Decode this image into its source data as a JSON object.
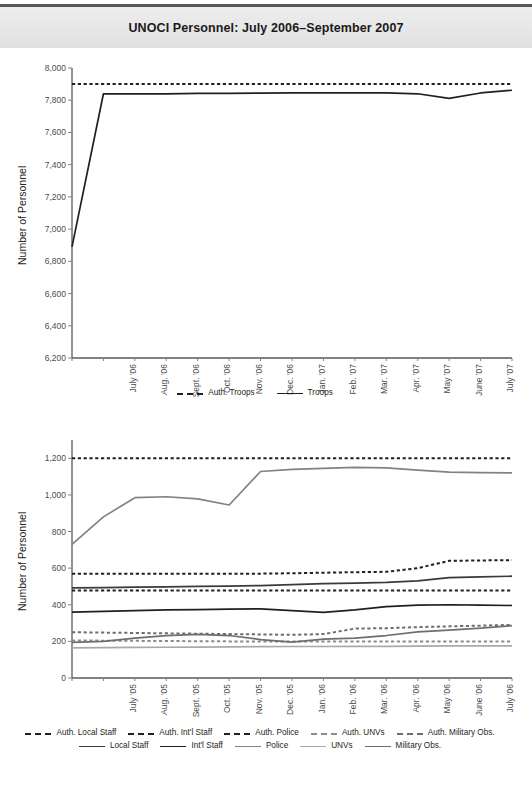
{
  "header": {
    "title": "UNOCI Personnel: July 2006–September 2007"
  },
  "chart_data": [
    {
      "id": "top",
      "type": "line",
      "title": "UNOCI Personnel: July 2006–September 2007",
      "xlabel": "",
      "ylabel": "Number of Personnel",
      "ylim": [
        6200,
        8000
      ],
      "ytick_labels": [
        "8,000",
        "7,800",
        "7,600",
        "7,400",
        "7,200",
        "7,000",
        "6,800",
        "6,600",
        "6,400",
        "6,200"
      ],
      "yticks": [
        8000,
        7800,
        7600,
        7400,
        7200,
        7000,
        6800,
        6600,
        6400,
        6200
      ],
      "grid": false,
      "legend_position": "bottom",
      "categories": [
        "July '06",
        "Aug. '06",
        "Sept. '06",
        "Oct. '06",
        "Nov. '06",
        "Dec. '06",
        "Jan. '07",
        "Feb. '07",
        "Mar. '07",
        "Apr. '07",
        "May '07",
        "June '07",
        "July '07",
        "Aug. '07",
        "Sept. '07"
      ],
      "series": [
        {
          "name": "Auth. Troops",
          "style": "dashed",
          "color": "#231f20",
          "values": [
            7900,
            7900,
            7900,
            7900,
            7900,
            7900,
            7900,
            7900,
            7900,
            7900,
            7900,
            7900,
            7900,
            7900,
            7900
          ]
        },
        {
          "name": "Troops",
          "style": "solid",
          "color": "#231f20",
          "values": [
            6890,
            7840,
            7840,
            7840,
            7842,
            7843,
            7844,
            7845,
            7845,
            7846,
            7845,
            7840,
            7812,
            7845,
            7862
          ]
        }
      ]
    },
    {
      "id": "bottom",
      "type": "line",
      "title": "",
      "xlabel": "",
      "ylabel": "Number of Personnel",
      "ylim": [
        0,
        1300
      ],
      "ytick_labels": [
        "1,200",
        "1,000",
        "800",
        "600",
        "400",
        "200",
        "0"
      ],
      "yticks": [
        1200,
        1000,
        800,
        600,
        400,
        200,
        0
      ],
      "grid": false,
      "legend_position": "bottom",
      "categories": [
        "July '05",
        "Aug. '05",
        "Sept. '05",
        "Oct. '05",
        "Nov. '05",
        "Dec. '05",
        "Jan. '06",
        "Feb. '06",
        "Mar. '06",
        "Apr. '06",
        "May '06",
        "June '06",
        "July '06",
        "Aug. '06",
        "Sept. '06"
      ],
      "series": [
        {
          "name": "Auth. Local Staff",
          "style": "dashed",
          "color": "#231f20",
          "values": [
            570,
            570,
            570,
            570,
            570,
            570,
            570,
            572,
            575,
            578,
            580,
            600,
            640,
            642,
            644
          ]
        },
        {
          "name": "Auth. Int'l Staff",
          "style": "dashed",
          "color": "#231f20",
          "values": [
            478,
            478,
            478,
            478,
            478,
            478,
            478,
            478,
            478,
            478,
            478,
            478,
            478,
            478,
            478
          ]
        },
        {
          "name": "Auth. Police",
          "style": "dashed",
          "color": "#231f20",
          "values": [
            1200,
            1200,
            1200,
            1200,
            1200,
            1200,
            1200,
            1200,
            1200,
            1200,
            1200,
            1200,
            1200,
            1200,
            1200
          ]
        },
        {
          "name": "Auth. UNVs",
          "style": "dashed",
          "color": "#8c8c8c",
          "values": [
            205,
            204,
            203,
            202,
            201,
            200,
            200,
            200,
            200,
            200,
            200,
            200,
            200,
            200,
            200
          ]
        },
        {
          "name": "Auth. Military Obs.",
          "style": "dashed",
          "color": "#6d6e71",
          "values": [
            250,
            248,
            246,
            244,
            242,
            240,
            238,
            236,
            240,
            270,
            272,
            278,
            282,
            286,
            290
          ]
        },
        {
          "name": "Local Staff",
          "style": "solid",
          "color": "#3a3a3a",
          "values": [
            492,
            494,
            496,
            498,
            500,
            502,
            505,
            510,
            515,
            518,
            522,
            530,
            548,
            552,
            556
          ]
        },
        {
          "name": "Int'l Staff",
          "style": "solid",
          "color": "#231f20",
          "values": [
            360,
            364,
            368,
            372,
            374,
            376,
            378,
            368,
            358,
            372,
            390,
            398,
            400,
            398,
            396
          ]
        },
        {
          "name": "Police",
          "style": "solid",
          "color": "#808285",
          "values": [
            730,
            880,
            985,
            990,
            978,
            945,
            1128,
            1140,
            1145,
            1150,
            1148,
            1135,
            1125,
            1122,
            1120
          ]
        },
        {
          "name": "UNVs",
          "style": "solid",
          "color": "#a7a9ac",
          "values": [
            165,
            166,
            167,
            168,
            169,
            170,
            171,
            172,
            172,
            173,
            173,
            174,
            175,
            176,
            176
          ]
        },
        {
          "name": "Military Obs.",
          "style": "solid",
          "color": "#6d6e71",
          "values": [
            195,
            200,
            218,
            232,
            238,
            232,
            210,
            196,
            212,
            218,
            232,
            252,
            262,
            272,
            286
          ]
        }
      ]
    }
  ],
  "legends": {
    "top": [
      {
        "label": "Auth. Troops",
        "style": "dashed",
        "color": "#231f20"
      },
      {
        "label": "Troops",
        "style": "solid",
        "color": "#231f20"
      }
    ],
    "bottom_row1": [
      {
        "label": "Auth. Local Staff",
        "style": "dashed",
        "color": "#231f20"
      },
      {
        "label": "Auth. Int'l  Staff",
        "style": "dashed",
        "color": "#231f20"
      },
      {
        "label": "Auth. Police",
        "style": "dashed",
        "color": "#231f20"
      },
      {
        "label": "Auth. UNVs",
        "style": "dashed",
        "color": "#8c8c8c"
      },
      {
        "label": "Auth. Military Obs.",
        "style": "dashed",
        "color": "#6d6e71"
      }
    ],
    "bottom_row2": [
      {
        "label": "Local Staff",
        "style": "solid",
        "color": "#3a3a3a"
      },
      {
        "label": "Int'l Staff",
        "style": "solid",
        "color": "#231f20"
      },
      {
        "label": "Police",
        "style": "solid",
        "color": "#808285"
      },
      {
        "label": "UNVs",
        "style": "solid",
        "color": "#a7a9ac"
      },
      {
        "label": "Military Obs.",
        "style": "solid",
        "color": "#6d6e71"
      }
    ]
  }
}
